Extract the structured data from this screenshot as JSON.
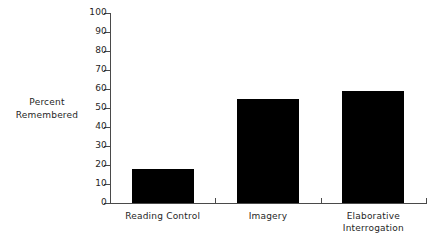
{
  "chart_data": {
    "type": "bar",
    "title": "",
    "xlabel": "",
    "ylabel": "Percent Remembered",
    "ylabel_lines": [
      "Percent",
      "Remembered"
    ],
    "categories": [
      "Reading Control",
      "Imagery",
      "Elaborative Interrogation"
    ],
    "category_label_lines": [
      [
        "Reading Control"
      ],
      [
        "Imagery"
      ],
      [
        "Elaborative",
        "Interrogation"
      ]
    ],
    "values": [
      18,
      55,
      59
    ],
    "ylim": [
      0,
      100
    ],
    "ytick_step": 10,
    "yticks": [
      0,
      10,
      20,
      30,
      40,
      50,
      60,
      70,
      80,
      90,
      100
    ],
    "ytick_labels": [
      "0",
      "10",
      "20",
      "30",
      "40",
      "50",
      "60",
      "70",
      "80",
      "90",
      "100"
    ],
    "grid": false,
    "legend": false,
    "legend_position": "none",
    "bar_color": "#000000",
    "axis_color": "#4a4a4a",
    "background_color": "#ffffff"
  }
}
